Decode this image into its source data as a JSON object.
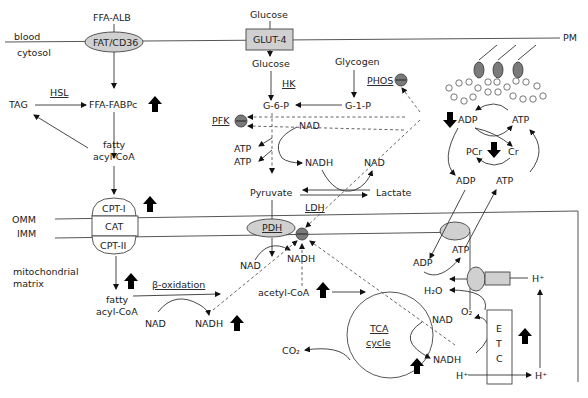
{
  "regions": {
    "blood": "blood",
    "cytosol": "cytosol",
    "pm": "PM",
    "omm": "OMM",
    "imm": "IMM",
    "matrix_line1": "mitochondrial",
    "matrix_line2": "matrix"
  },
  "transporters": {
    "ffa_alb": "FFA-ALB",
    "fat_cd36": "FAT/CD36",
    "glucose_ext": "Glucose",
    "glut4": "GLUT-4",
    "cpt1": "CPT-I",
    "cat": "CAT",
    "cpt2": "CPT-II",
    "pdh": "PDH",
    "etc_letters": [
      "E",
      "T",
      "C"
    ]
  },
  "enzymes": {
    "hsl": "HSL",
    "hk": "HK",
    "phos": "PHOS",
    "pfk": "PFK",
    "ldh": "LDH",
    "beta_oxidation": "β-oxidation",
    "tca_line1": "TCA",
    "tca_line2": "cycle"
  },
  "metabolites": {
    "tag": "TAG",
    "ffa_fabpc": "FFA-FABPc",
    "fatty_acyl_coa_cyt_1": "fatty",
    "fatty_acyl_coa_cyt_2": "acyl-CoA",
    "fatty_acyl_coa_mit_1": "fatty",
    "fatty_acyl_coa_mit_2": "acyl-CoA",
    "glucose_int": "Glucose",
    "glycogen": "Glycogen",
    "g6p": "G-6-P",
    "g1p": "G-1-P",
    "nad_gly": "NAD",
    "nadh_gly": "NADH",
    "nad_ldh": "NAD",
    "atp1": "ATP",
    "atp2": "ATP",
    "pyruvate": "Pyruvate",
    "lactate": "Lactate",
    "adp_top": "ADP",
    "atp_top": "ATP",
    "pcr": "PCr",
    "cr": "Cr",
    "adp_mid": "ADP",
    "atp_mid": "ATP",
    "adp_mit": "ADP",
    "atp_mit": "ATP",
    "nad_pdh": "NAD",
    "nadh_pdh": "NADH",
    "nad_beta": "NAD",
    "nadh_beta": "NADH",
    "acetyl_coa": "acetyl-CoA",
    "co2": "CO₂",
    "h2o": "H₂O",
    "o2": "O₂",
    "nad_etc": "NAD",
    "nadh_etc": "NADH",
    "h_plus_1": "H⁺",
    "h_plus_2": "H⁺",
    "h_plus_3": "H⁺"
  },
  "icons": {
    "up_arrow": "bold-up-arrow",
    "down_arrow": "bold-down-arrow",
    "inhibition": "inhibition-circle"
  },
  "colors": {
    "membrane_protein": "#d0d0d0",
    "inhibitor": "#7a7a7a",
    "arrow": "#000000"
  }
}
